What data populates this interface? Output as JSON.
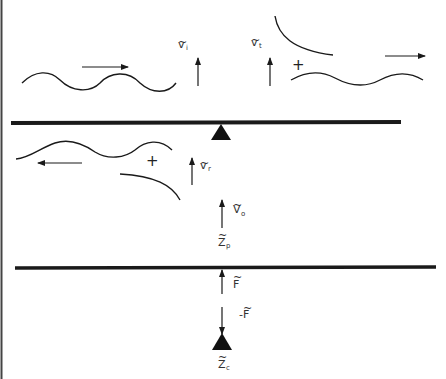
{
  "diagram": {
    "type": "wave transmission through plate with point support (impedance schematic)",
    "labels": {
      "incident_velocity": {
        "base": "v",
        "sub": "i"
      },
      "transmitted_velocity": {
        "base": "v",
        "sub": "t"
      },
      "reflected_velocity": {
        "base": "v",
        "sub": "r"
      },
      "plate_velocity": {
        "base": "V",
        "sub": "o"
      },
      "plate_impedance": {
        "base": "Z",
        "sub": "p"
      },
      "force": {
        "base": "F",
        "sub": ""
      },
      "reaction_force": {
        "base": "-F",
        "sub": ""
      },
      "connection_impedance": {
        "base": "Z",
        "sub": "c"
      }
    },
    "plus_sign": "+",
    "colors": {
      "ink": "#1a1a1a",
      "label": "#333333",
      "background": "#ffffff"
    }
  }
}
